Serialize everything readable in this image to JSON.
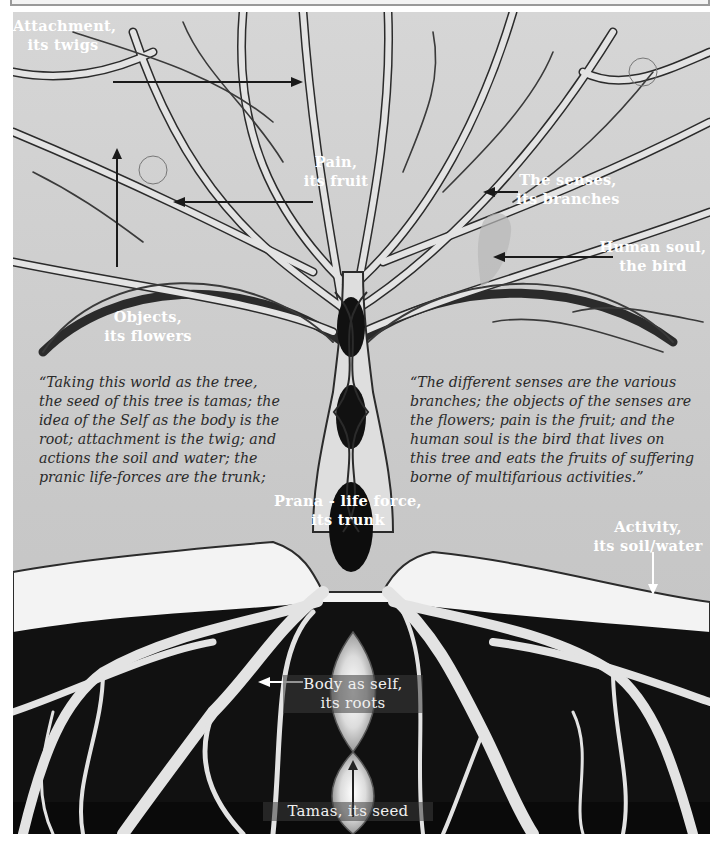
{
  "diagram": {
    "labels": {
      "twigs": {
        "line1": "Attachment,",
        "line2": "its twigs"
      },
      "fruit": {
        "line1": "Pain,",
        "line2": "its fruit"
      },
      "branches": {
        "line1": "The senses,",
        "line2": "its branches"
      },
      "bird": {
        "line1": "Human soul,",
        "line2": "the bird"
      },
      "flowers": {
        "line1": "Objects,",
        "line2": "its flowers"
      },
      "trunk": {
        "line1": "Prana - life force,",
        "line2": "its trunk"
      },
      "soil": {
        "line1": "Activity,",
        "line2": "its soil/water"
      },
      "roots": {
        "line1": "Body as self,",
        "line2": "its roots"
      },
      "seed": {
        "line1": "Tamas, its seed"
      }
    },
    "quote_left": {
      "lines": [
        "“Taking this world as the tree,",
        "the seed of this tree is tamas; the",
        "idea of the Self as the body is the",
        "root; attachment is the twig; and",
        "actions the soil and water; the",
        "pranic life-forces are the trunk;"
      ]
    },
    "quote_right": {
      "lines": [
        "“The different senses are the various",
        "branches; the objects of the senses are",
        "the flowers; pain is the fruit; and the",
        "human soul is the bird that lives on",
        "this tree and eats the fruits of suffering",
        "borne of multifarious activities.”"
      ]
    },
    "colors": {
      "sky": "#c9c9c9",
      "branch_fill": "#e2e2e2",
      "branch_outline": "#2b2b2b",
      "soil": "#f2f2f2",
      "underground": "#111111",
      "roots": "#e6e6e6",
      "label_text": "#ffffff",
      "quote_text": "#2a2a2a"
    }
  }
}
